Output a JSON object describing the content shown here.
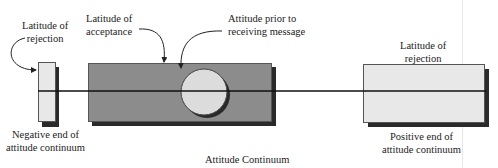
{
  "diagram": {
    "title": "Attitude Continuum",
    "labels": {
      "left_rejection": [
        "Latitude of",
        "rejection"
      ],
      "acceptance": [
        "Latitude of",
        "acceptance"
      ],
      "prior_attitude": [
        "Attitude prior to",
        "receiving message"
      ],
      "right_rejection": [
        "Latitude of",
        "rejection"
      ],
      "negative_end": [
        "Negative end of",
        "attitude continuum"
      ],
      "positive_end": [
        "Positive end of",
        "attitude continuum"
      ]
    },
    "colors": {
      "rejection_fill": "#e8e8e8",
      "acceptance_fill": "#8c8c8c",
      "circle_fill": "#dcdcdc",
      "shadow": "#2a2a2a",
      "line": "#111111"
    }
  }
}
